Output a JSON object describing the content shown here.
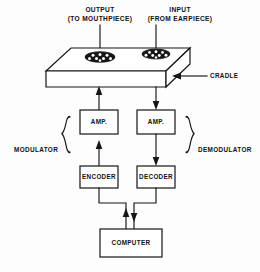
{
  "diagram": {
    "type": "block-diagram",
    "background_color": "#fdfdfd",
    "line_color": "#151515",
    "annotations": {
      "output_label_line1": "OUTPUT",
      "output_label_line2": "(TO MOUTHPIECE)",
      "input_label_line1": "INPUT",
      "input_label_line2": "(FROM EARPIECE)",
      "cradle_label": "CRADLE",
      "modulator_label": "MODULATOR",
      "demodulator_label": "DEMODULATOR"
    },
    "blocks": [
      {
        "id": "amp-left",
        "label": "AMP.",
        "branch": "modulator"
      },
      {
        "id": "amp-right",
        "label": "AMP.",
        "branch": "demodulator"
      },
      {
        "id": "encoder",
        "label": "ENCODER",
        "branch": "modulator"
      },
      {
        "id": "decoder",
        "label": "DECODER",
        "branch": "demodulator"
      },
      {
        "id": "computer",
        "label": "COMPUTER",
        "branch": "shared"
      }
    ],
    "cradle": {
      "name": "CRADLE",
      "cups": [
        {
          "id": "cup-output",
          "connects_to": "OUTPUT"
        },
        {
          "id": "cup-input",
          "connects_to": "INPUT"
        }
      ]
    },
    "signal_flow": [
      {
        "from": "COMPUTER",
        "to": "ENCODER",
        "direction": "up"
      },
      {
        "from": "ENCODER",
        "to": "AMP.",
        "direction": "up"
      },
      {
        "from": "AMP.",
        "to": "CRADLE",
        "direction": "up"
      },
      {
        "from": "CRADLE",
        "to": "AMP.",
        "direction": "down"
      },
      {
        "from": "AMP.",
        "to": "DECODER",
        "direction": "down"
      },
      {
        "from": "DECODER",
        "to": "COMPUTER",
        "direction": "down"
      }
    ]
  }
}
